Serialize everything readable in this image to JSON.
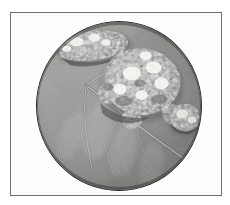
{
  "figure": {
    "kind": "photomicrograph-plate",
    "frame_label": "specimen plate border",
    "background_color": "#ffffff",
    "frame_color": "#6f7073",
    "circle_outline_color": "#2b2b2d",
    "caption": ""
  },
  "photo": {
    "subject": "leaf surface with powdery fungal lesions",
    "rendering": "grayscale",
    "field_shape": "circular",
    "alt_text": "Grayscale circular magnified view of a leaf showing radiating veins and three whitish powdery mildew lesions",
    "base_tone": "#8d8d8c",
    "mid_tone": "#9a9a98",
    "shadow_tone": "#5d5d5e",
    "lesion_tone": "#ebebe8",
    "vein_tone": "#b4b4b1"
  },
  "features": {
    "vein_origin": {
      "x": 52,
      "y": 64
    },
    "midrib_label": "primary midrib",
    "lateral_vein_count": 7,
    "lesions": [
      {
        "name": "lesion-top-left",
        "cx": 50,
        "cy": 22,
        "rx": 26,
        "ry": 13,
        "intensity": "bright"
      },
      {
        "name": "lesion-center",
        "cx": 104,
        "cy": 62,
        "rx": 38,
        "ry": 32,
        "intensity": "bright"
      },
      {
        "name": "lesion-right-edge",
        "cx": 148,
        "cy": 98,
        "rx": 16,
        "ry": 13,
        "intensity": "bright"
      }
    ]
  }
}
